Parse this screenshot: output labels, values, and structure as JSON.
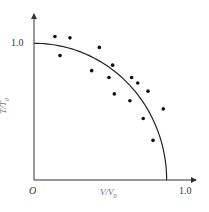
{
  "chart_data": {
    "type": "scatter",
    "title": "",
    "xlabel": "V/V0",
    "ylabel": "T/T0",
    "origin_label": "O",
    "xlim": [
      0,
      1.0
    ],
    "ylim": [
      0,
      1.0
    ],
    "x_ticks": [
      "1.0"
    ],
    "y_ticks": [
      "1.0"
    ],
    "grid": false,
    "legend": null,
    "series": [
      {
        "name": "measured",
        "kind": "scatter",
        "points": [
          [
            0.135,
            1.05
          ],
          [
            0.233,
            1.04
          ],
          [
            0.168,
            0.91
          ],
          [
            0.425,
            0.97
          ],
          [
            0.375,
            0.8
          ],
          [
            0.512,
            0.84
          ],
          [
            0.488,
            0.75
          ],
          [
            0.523,
            0.63
          ],
          [
            0.636,
            0.75
          ],
          [
            0.676,
            0.71
          ],
          [
            0.625,
            0.58
          ],
          [
            0.743,
            0.65
          ],
          [
            0.712,
            0.45
          ],
          [
            0.843,
            0.52
          ],
          [
            0.776,
            0.29
          ]
        ]
      },
      {
        "name": "fit curve",
        "kind": "line",
        "description": "elliptical quarter curve from (0,1.0) to (0.865,0)",
        "y_intercept": 1.0,
        "x_intercept": 0.865
      }
    ]
  },
  "labels": {
    "origin": "O",
    "x_tick": "1.0",
    "y_tick": "1.0",
    "x_axis_main": "V/V",
    "x_axis_sub": "0",
    "y_axis_main": "T/T",
    "y_axis_sub": "0"
  }
}
